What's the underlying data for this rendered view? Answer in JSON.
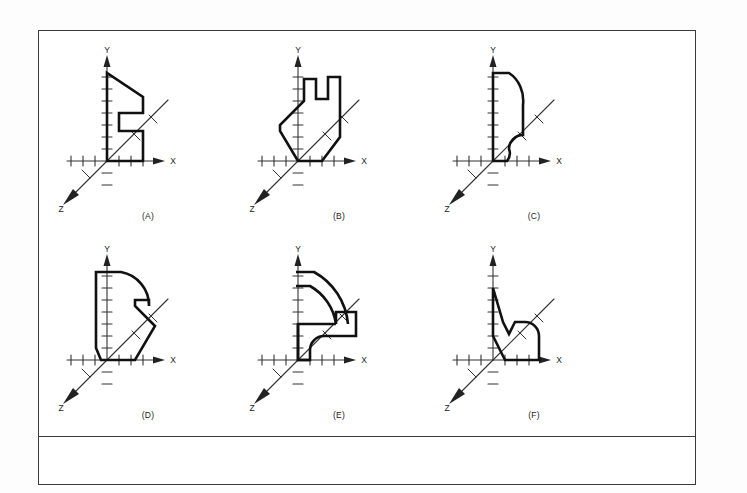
{
  "plate": {
    "title": "orthographic-profile-plate",
    "background_color": "#ffffff",
    "frame_color": "#3a3a3a",
    "line_color": "#111111",
    "axis_color": "#333333"
  },
  "axes": {
    "x_label": "X",
    "y_label": "Y",
    "z_label": "Z",
    "tick_count_positive_x": 6,
    "tick_count_negative_x": 3,
    "tick_count_positive_y": 7,
    "tick_count_negative_y": 3,
    "tick_spacing_px": 12,
    "z_direction": "down-left-45deg"
  },
  "diagrams": [
    {
      "id": "A",
      "label": "(A)",
      "row": 0,
      "col": 0,
      "description": "Stepped profile: tall left wall, slanted upper right edge, rectangular notch cut into lower right",
      "outline": "M 0,-88 L 0,0 L 36,0 L 36,-30 L 12,-30 L 12,-48 L 36,-48 L 36,-64 L 0,-88 Z",
      "path": "M 0,0 L 0,-88 L 36,-64 L 36,-48 L 12,-48 L 12,-30 L 36,-30 L 36,0 Z"
    },
    {
      "id": "B",
      "label": "(B)",
      "row": 0,
      "col": 1,
      "description": "C-shaped bracket with slanted lower edge running from origin up-right",
      "path": "M 0,0 L 0,-36 L -18,-36 L -18,-60 L 18,-84 L 42,-84 L 42,-80 L 18,-80 L 18,-62 L 42,-62 L 42,-36 L 30,0 Z"
    },
    {
      "id": "C",
      "label": "(C)",
      "row": 0,
      "col": 2,
      "description": "Tall profile with large top-right fillet arc and small concave fillet at bottom right",
      "path": "M 0,0 L 0,-88 L 24,-88 A 30 34 0 0 1 36,-50 L 36,-28 A 14 14 0 0 0 22,-14 A 14 14 0 0 0 14,0 Z"
    },
    {
      "id": "D",
      "label": "(D)",
      "row": 1,
      "col": 0,
      "description": "Rounded top-right lobe with angled lower chamfers and a notched right step",
      "path": "M -1,-88 L 24,-88 A 34 34 0 0 1 50,-46 L 50,-28 L 50,-52 L 36,-52 L 36,-46 L 14,0 L -12,0 Z"
    },
    {
      "id": "E",
      "label": "(E)",
      "row": 1,
      "col": 1,
      "description": "Quarter-annulus arc over a cross / T-shaped base block with concave fillet",
      "path": "M 0,-88 L 0,-74 A 62 62 0 0 1 58,-22 L 44,-22"
    },
    {
      "id": "F",
      "label": "(F)",
      "row": 1,
      "col": 2,
      "description": "Low stepped silhouette: tall spike at left, V notch, rounded right end, flat base on X axis",
      "path": "M 0,-72 L 0,-24 L 14,0 L 78,0 L 78,-28 A 16 16 0 0 0 62,-44 L 40,-44 L 30,-30 L 22,-44 L 24,-48 L 0,-72 Z"
    }
  ]
}
